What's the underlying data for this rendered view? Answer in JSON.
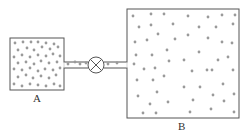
{
  "diagram": {
    "containers": [
      {
        "id": "A",
        "label": "A",
        "x": 10,
        "y": 38,
        "w": 54,
        "h": 52,
        "dots": [
          [
            15,
            43
          ],
          [
            23,
            42
          ],
          [
            31,
            42
          ],
          [
            38,
            42
          ],
          [
            46,
            43
          ],
          [
            54,
            44
          ],
          [
            18,
            50
          ],
          [
            27,
            48
          ],
          [
            34,
            50
          ],
          [
            42,
            47
          ],
          [
            50,
            49
          ],
          [
            58,
            47
          ],
          [
            14,
            57
          ],
          [
            22,
            55
          ],
          [
            30,
            57
          ],
          [
            38,
            55
          ],
          [
            46,
            56
          ],
          [
            53,
            54
          ],
          [
            60,
            56
          ],
          [
            18,
            63
          ],
          [
            26,
            62
          ],
          [
            34,
            64
          ],
          [
            41,
            61
          ],
          [
            49,
            63
          ],
          [
            57,
            62
          ],
          [
            14,
            69
          ],
          [
            22,
            70
          ],
          [
            30,
            68
          ],
          [
            38,
            71
          ],
          [
            45,
            69
          ],
          [
            53,
            70
          ],
          [
            60,
            68
          ],
          [
            18,
            77
          ],
          [
            26,
            75
          ],
          [
            33,
            78
          ],
          [
            41,
            76
          ],
          [
            49,
            78
          ],
          [
            56,
            75
          ],
          [
            14,
            84
          ],
          [
            22,
            86
          ],
          [
            30,
            84
          ],
          [
            38,
            85
          ],
          [
            46,
            86
          ],
          [
            54,
            84
          ],
          [
            60,
            86
          ]
        ]
      },
      {
        "id": "B",
        "label": "B",
        "x": 127,
        "y": 9,
        "w": 112,
        "h": 109,
        "dots": [
          [
            133,
            16
          ],
          [
            151,
            14
          ],
          [
            164,
            14
          ],
          [
            188,
            16
          ],
          [
            208,
            17
          ],
          [
            222,
            15
          ],
          [
            235,
            15
          ],
          [
            139,
            27
          ],
          [
            151,
            25
          ],
          [
            173,
            24
          ],
          [
            199,
            27
          ],
          [
            216,
            27
          ],
          [
            233,
            24
          ],
          [
            158,
            34
          ],
          [
            188,
            35
          ],
          [
            135,
            42
          ],
          [
            147,
            40
          ],
          [
            175,
            39
          ],
          [
            208,
            38
          ],
          [
            222,
            42
          ],
          [
            232,
            43
          ],
          [
            167,
            50
          ],
          [
            199,
            52
          ],
          [
            136,
            55
          ],
          [
            152,
            55
          ],
          [
            228,
            57
          ],
          [
            134,
            64
          ],
          [
            169,
            61
          ],
          [
            184,
            60
          ],
          [
            218,
            60
          ],
          [
            212,
            70
          ],
          [
            144,
            69
          ],
          [
            155,
            68
          ],
          [
            192,
            71
          ],
          [
            207,
            70
          ],
          [
            233,
            70
          ],
          [
            164,
            76
          ],
          [
            137,
            80
          ],
          [
            153,
            80
          ],
          [
            223,
            84
          ],
          [
            184,
            87
          ],
          [
            200,
            87
          ],
          [
            157,
            92
          ],
          [
            138,
            96
          ],
          [
            213,
            95
          ],
          [
            234,
            94
          ],
          [
            150,
            104
          ],
          [
            168,
            102
          ],
          [
            193,
            100
          ],
          [
            224,
            101
          ],
          [
            143,
            113
          ],
          [
            156,
            113
          ],
          [
            190,
            112
          ],
          [
            211,
            109
          ],
          [
            234,
            112
          ]
        ]
      }
    ],
    "pipe": {
      "x1": 64,
      "x2": 127,
      "y": 65,
      "dots": [
        [
          68,
          64
        ],
        [
          75,
          62
        ],
        [
          80,
          64
        ],
        [
          86,
          63
        ],
        [
          108,
          64
        ],
        [
          117,
          63
        ]
      ]
    },
    "valve": {
      "cx": 96,
      "cy": 65,
      "r": 8,
      "type": "closed-valve"
    },
    "colors": {
      "outline": "#555555",
      "dot": "#9a9a9a"
    }
  }
}
